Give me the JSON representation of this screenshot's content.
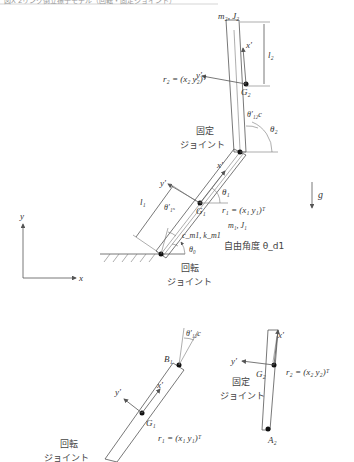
{
  "caption": "図X 2リンク倒立振子モデル（回転・固定ジョイント）",
  "upper_diagram": {
    "link2": {
      "mass_inertia": "m₂, J₂",
      "length": "l₂",
      "cog": "G₂",
      "axis_x": "x′",
      "axis_y": "y′",
      "position_vector": "r₂ = (x₂  y₂)ᵀ",
      "angle": "θ₂",
      "offset_angle": "θ′₁₂c"
    },
    "fixed_joint_label_1": "固定",
    "fixed_joint_label_2": "ジョイント",
    "link1": {
      "mass_inertia": "m₁, J₁",
      "length": "l₁",
      "cog": "G₁",
      "axis_x": "x′",
      "axis_y": "y′",
      "position_vector": "r₁ = (x₁  y₁)ᵀ",
      "angle": "θ₁",
      "offset_angle": "θ′₁ₛ",
      "spring_damper": "c_m1, k_m1"
    },
    "base_angle": "θ₀",
    "free_angle_label": "自由角度 θ_d1",
    "rotary_joint_label_1": "回転",
    "rotary_joint_label_2": "ジョイント",
    "gravity": "g",
    "world_axes": {
      "x": "x",
      "y": "y"
    }
  },
  "lower_diagram": {
    "link1": {
      "end_point": "B₁",
      "cog": "G₁",
      "axis_x": "x′",
      "axis_y": "y′",
      "position_vector": "r₁ = (x₁  y₁)ᵀ",
      "offset_angle": "θ′₁₂c"
    },
    "link2": {
      "end_point": "A₂",
      "cog": "G₂",
      "axis_x": "x′",
      "axis_y": "y′",
      "position_vector": "r₂ = (x₂  y₂)ᵀ"
    },
    "fixed_joint_label_1": "固定",
    "fixed_joint_label_2": "ジョイント",
    "rotary_joint_label_1": "回転",
    "rotary_joint_label_2": "ジョイント"
  }
}
